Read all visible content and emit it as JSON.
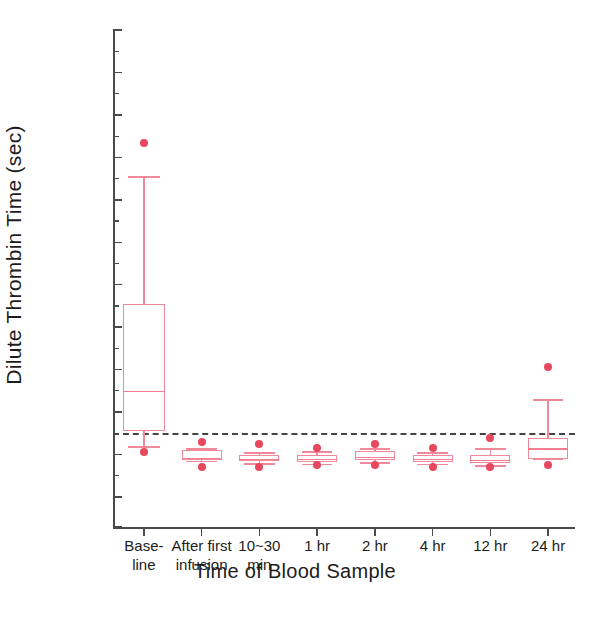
{
  "chart_data": {
    "type": "box",
    "title": "",
    "xlabel": "Time of Blood Sample",
    "ylabel": "Dilute Thrombin Time (sec)",
    "ylim": [
      0,
      130
    ],
    "y_ticks": [
      0,
      20,
      30,
      40,
      50,
      60,
      70,
      80,
      90,
      100,
      110,
      120,
      130
    ],
    "y_tick_labels": [
      "0",
      "20",
      "30",
      "40",
      "50",
      "60",
      "70",
      "80",
      "90",
      "100",
      "110",
      "120",
      "130"
    ],
    "grid": false,
    "legend": "none",
    "reference_line": {
      "value": 35,
      "style": "dashed",
      "color": "#444444",
      "label": ""
    },
    "categories": [
      "Base-\nline",
      "After first\ninfusion",
      "10~30\nmin",
      "1 hr",
      "2 hr",
      "4 hr",
      "12 hr",
      "24 hr"
    ],
    "boxes": [
      {
        "category": "Baseline",
        "whisker_low": 32.0,
        "q1": 35.5,
        "median": 45.0,
        "q3": 65.5,
        "whisker_high": 95.5,
        "outliers": [
          103.5,
          30.5
        ]
      },
      {
        "category": "After first infusion",
        "whisker_low": 28.5,
        "q1": 28.8,
        "median": 29.3,
        "q3": 31.0,
        "whisker_high": 31.5,
        "outliers": [
          33.0,
          27.0
        ]
      },
      {
        "category": "10~30 min",
        "whisker_low": 28.0,
        "q1": 28.5,
        "median": 29.0,
        "q3": 30.0,
        "whisker_high": 30.5,
        "outliers": [
          32.5,
          27.0
        ]
      },
      {
        "category": "1 hr",
        "whisker_low": 27.8,
        "q1": 28.2,
        "median": 29.0,
        "q3": 30.0,
        "whisker_high": 30.8,
        "outliers": [
          31.5,
          27.5
        ]
      },
      {
        "category": "2 hr",
        "whisker_low": 28.2,
        "q1": 28.8,
        "median": 29.5,
        "q3": 30.8,
        "whisker_high": 31.5,
        "outliers": [
          32.5,
          27.5
        ]
      },
      {
        "category": "4 hr",
        "whisker_low": 27.8,
        "q1": 28.3,
        "median": 29.0,
        "q3": 30.0,
        "whisker_high": 30.5,
        "outliers": [
          31.5,
          27.0
        ]
      },
      {
        "category": "12 hr",
        "whisker_low": 27.5,
        "q1": 28.0,
        "median": 28.8,
        "q3": 30.0,
        "whisker_high": 31.5,
        "outliers": [
          34.0,
          27.0
        ]
      },
      {
        "category": "24 hr",
        "whisker_low": 29.0,
        "q1": 29.0,
        "median": 31.5,
        "q3": 34.0,
        "whisker_high": 43.0,
        "outliers": [
          50.7,
          27.5
        ]
      }
    ],
    "colors": {
      "box_edge": "#f08a9a",
      "median": "#f47c8d",
      "whisker": "#f08a9a",
      "outlier": "#e8485f",
      "axis": "#4a4a4a",
      "reference": "#444444",
      "text": "#1c1c1c"
    }
  }
}
